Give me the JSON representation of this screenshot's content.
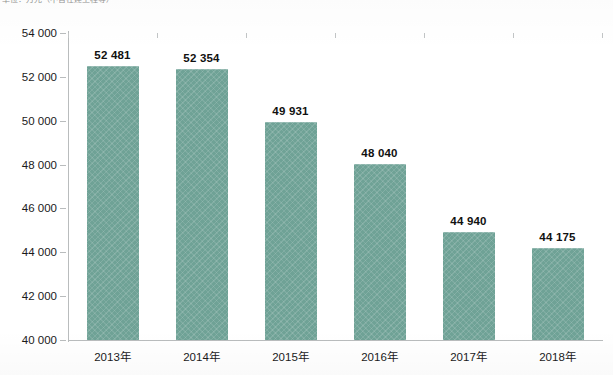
{
  "title_fragment": "单位：万元（不含在建工程等）",
  "chart_data": {
    "type": "bar",
    "title": "",
    "xlabel": "",
    "ylabel": "",
    "categories": [
      "2013年",
      "2014年",
      "2015年",
      "2016年",
      "2017年",
      "2018年"
    ],
    "values": [
      52481,
      52354,
      49931,
      48040,
      44940,
      44175
    ],
    "value_labels": [
      "52 481",
      "52 354",
      "49 931",
      "48 040",
      "44 940",
      "44 175"
    ],
    "ylim": [
      40000,
      54000
    ],
    "ytick_step": 2000,
    "ytick_labels": [
      "54 000",
      "52 000",
      "50 000",
      "48 000",
      "46 000",
      "44 000",
      "42 000",
      "40 000"
    ],
    "ytick_values": [
      54000,
      52000,
      50000,
      48000,
      46000,
      44000,
      42000,
      40000
    ],
    "grid": false,
    "legend": "none",
    "series": [
      {
        "name": "",
        "values": [
          52481,
          52354,
          49931,
          48040,
          44940,
          44175
        ]
      }
    ],
    "bar_color": "#6fa296",
    "axis_color": "#b9bcbd",
    "label_color": "#111111",
    "background": "#ffffff"
  }
}
